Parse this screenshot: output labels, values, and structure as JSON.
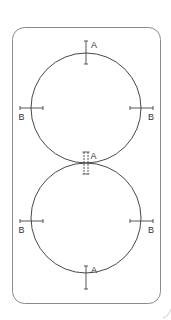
{
  "diagram": {
    "type": "two-circle measurement diagram",
    "colors": {
      "frame": "#8a8a8a",
      "circle": "#333333",
      "marker": "#444444",
      "label": "#333333",
      "background": "#ffffff"
    },
    "circles": [
      {
        "name": "top-circle",
        "cx": 86,
        "cy": 108,
        "r": 55
      },
      {
        "name": "bottom-circle",
        "cx": 86,
        "cy": 218,
        "r": 55
      }
    ],
    "labels": {
      "top_a": "A",
      "junction_a": "A",
      "bottom_a": "A",
      "top_left_b": "B",
      "top_right_b": "B",
      "bottom_left_b": "B",
      "bottom_right_b": "B"
    }
  }
}
